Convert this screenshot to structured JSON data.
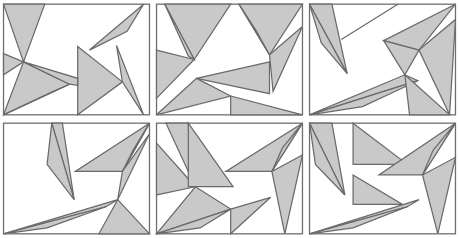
{
  "figure": {
    "title": "",
    "background_color": "#ffffff",
    "fill_color": "#c9c9c9",
    "stroke_color": "#6a6a6a",
    "frame_stroke_color": "#6e6e6e",
    "panel_count": 6,
    "columns": 3,
    "rows": 2,
    "panel_width": 153,
    "panel_height": 119
  },
  "panels": [
    {
      "id": "panel-1",
      "label": "",
      "frame": {
        "x": 3,
        "y": 3,
        "width": 124,
        "height": 94
      },
      "shapes": [
        {
          "name": "spike-upper-left",
          "points": "3,3 38,3 20,52"
        },
        {
          "name": "spike-upper-left-lower",
          "points": "3,45 20,52 3,63"
        },
        {
          "name": "sliver-top-right",
          "points": "76,42 122,3 108,26"
        },
        {
          "name": "wedge-lower-left",
          "points": "3,97 20,52 59,71"
        },
        {
          "name": "wedge-lower-left-lower",
          "points": "3,97 59,71 43,78"
        },
        {
          "name": "arrow-center",
          "points": "66,39 104,69 66,97"
        },
        {
          "name": "spike-right",
          "points": "99,38 104,69 122,97"
        },
        {
          "name": "center-band",
          "points": "20,52 66,66 66,72 59,71"
        }
      ]
    },
    {
      "id": "panel-2",
      "label": "",
      "frame": {
        "x": 3,
        "y": 3,
        "width": 124,
        "height": 94
      },
      "shapes": [
        {
          "name": "blade-upper-left",
          "points": "10,3 66,3 35,50"
        },
        {
          "name": "blade-upper-left-tail",
          "points": "10,3 35,50 30,47"
        },
        {
          "name": "blade-upper-right",
          "points": "73,3 127,3 99,46"
        },
        {
          "name": "blade-upper-right-tail",
          "points": "73,3 99,46 88,26"
        },
        {
          "name": "spike-right-down",
          "points": "99,46 127,22 102,77"
        },
        {
          "name": "wedge-left-mid",
          "points": "3,42 35,50 3,83"
        },
        {
          "name": "arrow-center-left",
          "points": "99,52 37,66 99,79"
        },
        {
          "name": "blade-lower-left",
          "points": "3,97 37,66 66,81"
        },
        {
          "name": "blade-lower-right",
          "points": "66,81 127,97 66,97"
        }
      ]
    },
    {
      "id": "panel-3",
      "label": "",
      "frame": {
        "x": 3,
        "y": 3,
        "width": 124,
        "height": 94
      },
      "shapes": [
        {
          "name": "spike-upper-left",
          "points": "3,3 22,3 35,62"
        },
        {
          "name": "spike-upper-left-tail",
          "points": "3,3 35,62 13,36"
        },
        {
          "name": "sliver-top-mid",
          "points": "30,33 78,3 62,13"
        },
        {
          "name": "chevron-upper",
          "points": "66,34 127,3 96,42"
        },
        {
          "name": "chevron-lower",
          "points": "66,34 96,42 84,63"
        },
        {
          "name": "spike-right-down",
          "points": "96,42 127,16 122,97"
        },
        {
          "name": "band-lower",
          "points": "3,97 84,63 95,68"
        },
        {
          "name": "band-lower-tail",
          "points": "3,97 95,68 48,90"
        },
        {
          "name": "spike-bottom-right",
          "points": "84,63 122,97 88,97"
        }
      ]
    },
    {
      "id": "panel-4",
      "label": "",
      "frame": {
        "x": 3,
        "y": 3,
        "width": 124,
        "height": 94
      },
      "shapes": [
        {
          "name": "blade-left-vertical",
          "points": "44,3 53,3 63,68"
        },
        {
          "name": "blade-left-vertical-tail",
          "points": "44,3 63,68 40,38"
        },
        {
          "name": "blade-upper-right",
          "points": "127,3 64,44 104,44"
        },
        {
          "name": "blade-upper-right-tail",
          "points": "127,3 104,44 113,26"
        },
        {
          "name": "spike-right-down",
          "points": "104,44 127,12 100,68"
        },
        {
          "name": "band-lower-left",
          "points": "3,97 100,68 90,74"
        },
        {
          "name": "band-lower-left-tail",
          "points": "3,97 90,74 40,92"
        },
        {
          "name": "spike-bottom-right",
          "points": "100,68 127,97 84,97"
        }
      ]
    },
    {
      "id": "panel-5",
      "label": "",
      "frame": {
        "x": 3,
        "y": 3,
        "width": 124,
        "height": 94
      },
      "shapes": [
        {
          "name": "spike-upper-left-a",
          "points": "11,3 30,3 36,57"
        },
        {
          "name": "spike-upper-left-b",
          "points": "3,20 36,57 3,64"
        },
        {
          "name": "arrow-left-block",
          "points": "30,3 68,57 30,57"
        },
        {
          "name": "blade-upper-right",
          "points": "127,3 62,44 101,44"
        },
        {
          "name": "blade-upper-right-tail",
          "points": "127,3 101,44 110,24"
        },
        {
          "name": "spike-right-down",
          "points": "101,44 127,30 112,97"
        },
        {
          "name": "wedge-lower-left",
          "points": "3,97 36,57 66,76"
        },
        {
          "name": "wedge-lower-left-tail",
          "points": "3,97 66,76 40,92"
        },
        {
          "name": "blade-bottom-mid",
          "points": "66,76 100,66 66,97"
        }
      ]
    },
    {
      "id": "panel-6",
      "label": "",
      "frame": {
        "x": 3,
        "y": 3,
        "width": 124,
        "height": 94
      },
      "shapes": [
        {
          "name": "spike-upper-left",
          "points": "3,3 22,3 33,64"
        },
        {
          "name": "spike-upper-left-tail",
          "points": "3,3 33,64 8,38"
        },
        {
          "name": "blade-upper-mid",
          "points": "40,3 86,38 40,38"
        },
        {
          "name": "chevron-right",
          "points": "127,3 62,47 99,47"
        },
        {
          "name": "chevron-right-tail",
          "points": "127,3 99,47 108,26"
        },
        {
          "name": "spike-right-down",
          "points": "99,47 127,32 112,97"
        },
        {
          "name": "arrow-center-left",
          "points": "40,47 82,72 40,72"
        },
        {
          "name": "band-lower",
          "points": "3,97 96,68 86,74"
        },
        {
          "name": "band-lower-tail",
          "points": "3,97 86,74 40,92"
        }
      ]
    }
  ]
}
